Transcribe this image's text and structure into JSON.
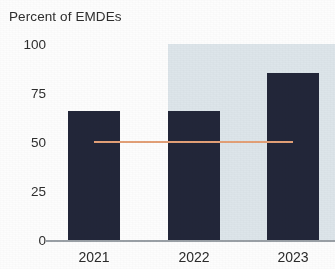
{
  "chart_data": {
    "type": "bar",
    "title": "Percent of EMDEs",
    "subtitle": "",
    "xlabel": "",
    "ylabel": "Percent of EMDEs",
    "categories": [
      "2021",
      "2022",
      "2023"
    ],
    "values": [
      66,
      66,
      85
    ],
    "series": [
      {
        "name": "Percent of EMDEs",
        "values": [
          66,
          66,
          85
        ],
        "color": "#222639"
      }
    ],
    "ylim": [
      0,
      100
    ],
    "yticks": [
      0,
      25,
      50,
      75,
      100
    ],
    "ytick_labels": [
      "0",
      "25",
      "50",
      "75",
      "100"
    ],
    "xtick_labels": [
      "2021",
      "2022",
      "2023"
    ],
    "grid": false,
    "legend": "none",
    "annotations": [
      {
        "name": "reference-line",
        "type": "hline",
        "value": 50,
        "color": "#e3a077",
        "x_start_category": "2021",
        "x_end_category": "2023"
      },
      {
        "name": "forecast-band",
        "type": "vspan",
        "label": "",
        "color": "#dde5ea",
        "x_start_category": "2022",
        "x_end_category": "2023",
        "y_from": 0,
        "y_to": 100
      }
    ]
  },
  "colors": {
    "bar": "#222639",
    "forecast_band": "#dde5ea",
    "reference_line": "#e3a077",
    "axis": "#9aa0a6",
    "text": "#2a2a2a",
    "background": "#fdfdfd"
  },
  "axis": {
    "y_ticks": [
      {
        "label": "100",
        "value": 100
      },
      {
        "label": "75",
        "value": 75
      },
      {
        "label": "50",
        "value": 50
      },
      {
        "label": "25",
        "value": 25
      },
      {
        "label": "0",
        "value": 0
      }
    ],
    "x_ticks": [
      {
        "label": "2021"
      },
      {
        "label": "2022"
      },
      {
        "label": "2023"
      }
    ]
  },
  "title": {
    "text": "Percent of EMDEs"
  }
}
